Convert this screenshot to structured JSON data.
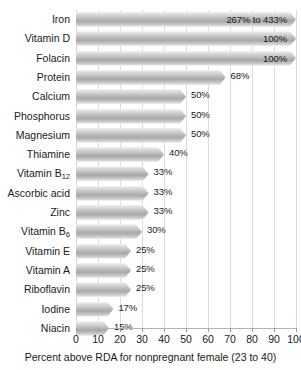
{
  "chart_data": {
    "type": "bar",
    "orientation": "horizontal",
    "title": "",
    "subtitle": "",
    "xlabel": "Percent above RDA for nonpregnant female (23 to 40)",
    "ylabel": "",
    "xlim": [
      0,
      100
    ],
    "xticks": [
      0,
      10,
      20,
      30,
      40,
      50,
      60,
      70,
      80,
      90,
      100
    ],
    "xtick_labels": [
      "0",
      "10",
      "20",
      "30",
      "40",
      "50",
      "60",
      "70",
      "80",
      "90",
      "100"
    ],
    "grid": true,
    "grid_axis": "x",
    "legend": false,
    "legend_position": "none",
    "bar_style": "gray-gradient-arrow-tip",
    "categories": [
      "Iron",
      "Vitamin D",
      "Folacin",
      "Protein",
      "Calcium",
      "Phosphorus",
      "Magnesium",
      "Thiamine",
      "Vitamin B12",
      "Ascorbic acid",
      "Zinc",
      "Vitamin B6",
      "Vitamin E",
      "Vitamin A",
      "Riboflavin",
      "Iodine",
      "Niacin"
    ],
    "values": [
      100,
      100,
      100,
      68,
      50,
      50,
      50,
      40,
      33,
      33,
      33,
      30,
      25,
      25,
      25,
      17,
      15
    ],
    "data_labels": [
      "267% to 433%",
      "100%",
      "100%",
      "68%",
      "50%",
      "50%",
      "50%",
      "40%",
      "33%",
      "33%",
      "33%",
      "30%",
      "25%",
      "25%",
      "25%",
      "17%",
      "15%"
    ],
    "bars": [
      {
        "label_html": "Iron",
        "value": 100,
        "data_label": "267% to 433%",
        "label_placement": "inside",
        "truncated": true
      },
      {
        "label_html": "Vitamin D",
        "value": 100,
        "data_label": "100%",
        "label_placement": "inside",
        "truncated": true
      },
      {
        "label_html": "Folacin",
        "value": 100,
        "data_label": "100%",
        "label_placement": "inside",
        "truncated": true
      },
      {
        "label_html": "Protein",
        "value": 68,
        "data_label": "68%",
        "label_placement": "outside",
        "truncated": false
      },
      {
        "label_html": "Calcium",
        "value": 50,
        "data_label": "50%",
        "label_placement": "outside",
        "truncated": false
      },
      {
        "label_html": "Phosphorus",
        "value": 50,
        "data_label": "50%",
        "label_placement": "outside",
        "truncated": false
      },
      {
        "label_html": "Magnesium",
        "value": 50,
        "data_label": "50%",
        "label_placement": "outside",
        "truncated": false
      },
      {
        "label_html": "Thiamine",
        "value": 40,
        "data_label": "40%",
        "label_placement": "outside",
        "truncated": false
      },
      {
        "label_html": "Vitamin B<sub>12</sub>",
        "value": 33,
        "data_label": "33%",
        "label_placement": "outside",
        "truncated": false
      },
      {
        "label_html": "Ascorbic acid",
        "value": 33,
        "data_label": "33%",
        "label_placement": "outside",
        "truncated": false
      },
      {
        "label_html": "Zinc",
        "value": 33,
        "data_label": "33%",
        "label_placement": "outside",
        "truncated": false
      },
      {
        "label_html": "Vitamin B<sub>6</sub>",
        "value": 30,
        "data_label": "30%",
        "label_placement": "outside",
        "truncated": false
      },
      {
        "label_html": "Vitamin E",
        "value": 25,
        "data_label": "25%",
        "label_placement": "outside",
        "truncated": false
      },
      {
        "label_html": "Vitamin A",
        "value": 25,
        "data_label": "25%",
        "label_placement": "outside",
        "truncated": false
      },
      {
        "label_html": "Riboflavin",
        "value": 25,
        "data_label": "25%",
        "label_placement": "outside",
        "truncated": false
      },
      {
        "label_html": "Iodine",
        "value": 17,
        "data_label": "17%",
        "label_placement": "outside",
        "truncated": false
      },
      {
        "label_html": "Niacin",
        "value": 15,
        "data_label": "15%",
        "label_placement": "outside",
        "truncated": false
      }
    ]
  },
  "colors": {
    "background": "#ffffff",
    "bar_light": "#f3f3f3",
    "bar_mid": "#a9a9a9",
    "gridline": "#dcdcdc",
    "axis": "#b4b4b4",
    "text": "#1a1a1a"
  }
}
